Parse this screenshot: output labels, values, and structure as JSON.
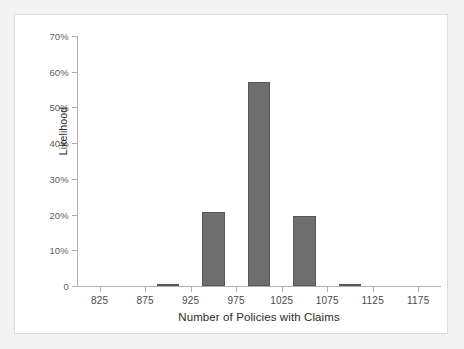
{
  "chart_data": {
    "type": "bar",
    "title": "",
    "subtitle": "",
    "xlabel": "Number of Policies with Claims",
    "ylabel": "Likelihood",
    "grid": false,
    "legend": "none",
    "bar_color": "#6e6e6e",
    "bar_edge_color": "#575757",
    "axis_color": "#b0b0b0",
    "xlim": [
      800,
      1200
    ],
    "ylim": [
      0,
      70
    ],
    "xticks": [
      825,
      875,
      925,
      975,
      1025,
      1075,
      1125,
      1175
    ],
    "xtick_labels": [
      "825",
      "875",
      "925",
      "975",
      "1025",
      "1075",
      "1125",
      "1175"
    ],
    "yticks": [
      0,
      10,
      20,
      30,
      40,
      50,
      60,
      70
    ],
    "ytick_labels": [
      "0",
      "10%",
      "20%",
      "30%",
      "40%",
      "50%",
      "60%",
      "70%"
    ],
    "bin_width": 25,
    "bars": [
      {
        "bin_center": 900,
        "bin_start": 887.5,
        "bin_end": 912.5,
        "value": 0.7
      },
      {
        "bin_center": 950,
        "bin_start": 937.5,
        "bin_end": 962.5,
        "value": 20.8
      },
      {
        "bin_center": 1000,
        "bin_start": 987.5,
        "bin_end": 1012.5,
        "value": 57.1
      },
      {
        "bin_center": 1050,
        "bin_start": 1037.5,
        "bin_end": 1062.5,
        "value": 19.5
      },
      {
        "bin_center": 1100,
        "bin_start": 1087.5,
        "bin_end": 1112.5,
        "value": 0.7
      }
    ],
    "categories": [
      "900",
      "950",
      "1000",
      "1050",
      "1100"
    ],
    "values": [
      0.7,
      20.8,
      57.1,
      19.5,
      0.7
    ]
  }
}
